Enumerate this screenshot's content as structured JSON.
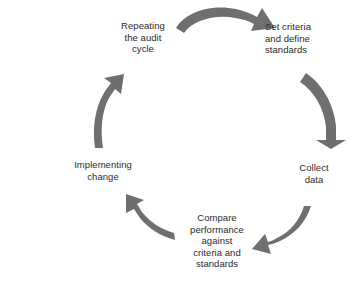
{
  "diagram": {
    "title": "Audit cycle",
    "type": "cycle-diagram",
    "direction": "clockwise",
    "background_color": "#ffffff",
    "arrow_color": "#6f6f6f",
    "text_color": "#2b2b2b",
    "nodes": [
      {
        "id": "repeating-audit-cycle",
        "label": "Repeating\nthe audit\ncycle",
        "position": "top-left",
        "align": "center"
      },
      {
        "id": "set-criteria",
        "label": "Set criteria\nand define\nstandards",
        "position": "top-right",
        "align": "left"
      },
      {
        "id": "collect-data",
        "label": "Collect\ndata",
        "position": "right",
        "align": "center"
      },
      {
        "id": "compare-performance",
        "label": "Compare\nperformance\nagainst\ncriteria and\nstandards",
        "position": "bottom",
        "align": "center"
      },
      {
        "id": "implementing-change",
        "label": "Implementing\nchange",
        "position": "left",
        "align": "center"
      }
    ],
    "arrows": [
      {
        "id": "arrow-top",
        "from": "repeating-audit-cycle",
        "to": "set-criteria",
        "points_to": "right"
      },
      {
        "id": "arrow-right",
        "from": "set-criteria",
        "to": "collect-data",
        "points_to": "down"
      },
      {
        "id": "arrow-bottom-right",
        "from": "collect-data",
        "to": "compare-performance",
        "points_to": "down-left"
      },
      {
        "id": "arrow-bottom-left",
        "from": "compare-performance",
        "to": "implementing-change",
        "points_to": "up-left"
      },
      {
        "id": "arrow-left",
        "from": "implementing-change",
        "to": "repeating-audit-cycle",
        "points_to": "up"
      }
    ]
  }
}
